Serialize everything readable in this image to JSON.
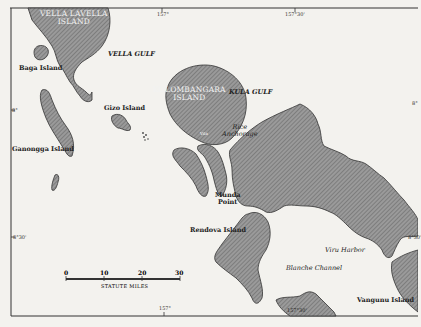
{
  "map": {
    "colors": {
      "paper": "#f3f2ee",
      "land_fill": "#8a8a8a",
      "land_outline": "#333333",
      "frame": "#333333"
    },
    "islands": [
      {
        "label": "VELLA LAVELLA\nISLAND",
        "line1": "VELLA LAVELLA",
        "line2": "ISLAND"
      },
      {
        "label": "Baga Island"
      },
      {
        "label": "KOLOMBANGARA\nISLAND",
        "line1": "KOLOMBANGARA",
        "line2": "ISLAND"
      },
      {
        "label": "Gizo Island"
      },
      {
        "label": "Ganongga Island"
      },
      {
        "label": "Rendova Island"
      },
      {
        "label": "Vangunu Island"
      }
    ],
    "water_bodies": [
      {
        "label": "VELLA GULF"
      },
      {
        "label": "KULA GULF"
      },
      {
        "label": "Blanche Channel"
      },
      {
        "label": "Rice Anchorage",
        "line1": "Rice",
        "line2": "Anchorage"
      },
      {
        "label": "Viru Harbor"
      }
    ],
    "places": [
      {
        "label": "Munda Point",
        "line1": "Munda",
        "line2": "Point"
      },
      {
        "label": "Vila"
      }
    ],
    "coordinates": {
      "top_157": "157°",
      "top_157_30": "157°30'",
      "left_8": "8°",
      "left_8_30": "8°30'",
      "bottom_157": "157°",
      "bottom_157_30": "157°30'",
      "right_8": "8°",
      "right_8_30": "8°30'"
    },
    "scale_bar": {
      "ticks": [
        "0",
        "10",
        "20",
        "30"
      ],
      "caption": "STATUTE MILES"
    }
  }
}
